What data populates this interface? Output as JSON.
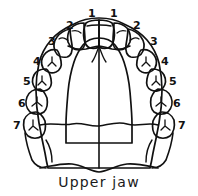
{
  "figure": {
    "caption": "Upper jaw",
    "ink_color": "#111111",
    "background_color": "#ffffff"
  },
  "labels": {
    "left": [
      {
        "id": "left-1",
        "text": "1",
        "x": 88,
        "y": 8,
        "tooth": "central-incisor"
      },
      {
        "id": "left-2",
        "text": "2",
        "x": 66,
        "y": 20,
        "tooth": "lateral-incisor"
      },
      {
        "id": "left-3",
        "text": "3",
        "x": 48,
        "y": 36,
        "tooth": "canine"
      },
      {
        "id": "left-4",
        "text": "4",
        "x": 33,
        "y": 56,
        "tooth": "first-premolar"
      },
      {
        "id": "left-5",
        "text": "5",
        "x": 23,
        "y": 76,
        "tooth": "second-premolar"
      },
      {
        "id": "left-6",
        "text": "6",
        "x": 18,
        "y": 98,
        "tooth": "first-molar"
      },
      {
        "id": "left-7",
        "text": "7",
        "x": 13,
        "y": 120,
        "tooth": "second-molar"
      }
    ],
    "right": [
      {
        "id": "right-1",
        "text": "1",
        "x": 110,
        "y": 8,
        "tooth": "central-incisor"
      },
      {
        "id": "right-2",
        "text": "2",
        "x": 133,
        "y": 20,
        "tooth": "lateral-incisor"
      },
      {
        "id": "right-3",
        "text": "3",
        "x": 150,
        "y": 36,
        "tooth": "canine"
      },
      {
        "id": "right-4",
        "text": "4",
        "x": 161,
        "y": 56,
        "tooth": "first-premolar"
      },
      {
        "id": "right-5",
        "text": "5",
        "x": 169,
        "y": 76,
        "tooth": "second-premolar"
      },
      {
        "id": "right-6",
        "text": "6",
        "x": 173,
        "y": 98,
        "tooth": "first-molar"
      },
      {
        "id": "right-7",
        "text": "7",
        "x": 178,
        "y": 120,
        "tooth": "second-molar"
      }
    ]
  }
}
